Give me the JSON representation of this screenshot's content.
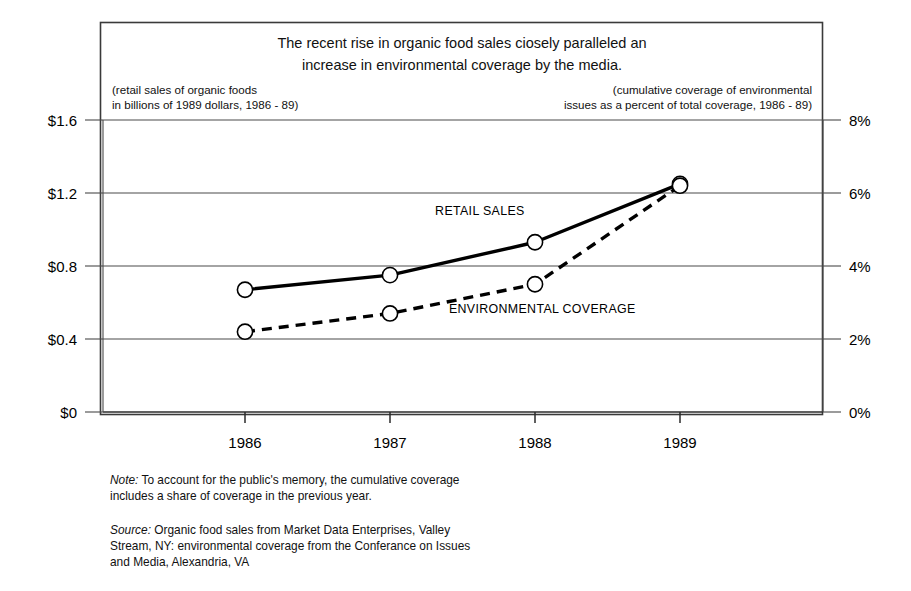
{
  "chart_data": {
    "type": "line",
    "title": "The recent rise in organic food sales ciosely paralleled an increase in environmental coverage by the media.",
    "title_line1": "The recent rise in organic food sales ciosely paralleled an",
    "title_line2": "increase in environmental coverage by the media.",
    "subtitle_left_line1": "(retail sales of organic foods",
    "subtitle_left_line2": "in billions of 1989 dollars, 1986 - 89)",
    "subtitle_right_line1": "(cumulative coverage of environmental",
    "subtitle_right_line2": "issues as a percent of total coverage, 1986 - 89)",
    "categories": [
      "1986",
      "1987",
      "1988",
      "1989"
    ],
    "x": [
      1986,
      1987,
      1988,
      1989
    ],
    "xlabel": "",
    "ylabel": "",
    "grid": true,
    "legend_position": "inline-annotations",
    "series": [
      {
        "name": "RETAIL SALES",
        "axis": "left",
        "style": "solid",
        "marker": "open-circle",
        "values": [
          0.67,
          0.75,
          0.93,
          1.25
        ],
        "unit": "billions of 1989 dollars"
      },
      {
        "name": "ENVIRONMENTAL COVERAGE",
        "axis": "right",
        "style": "dashed",
        "marker": "open-circle",
        "values": [
          2.2,
          2.7,
          3.5,
          6.2
        ],
        "unit": "percent of total coverage"
      }
    ],
    "yaxis_left": {
      "ticks": [
        0,
        0.4,
        0.8,
        1.2,
        1.6
      ],
      "tick_labels": [
        "$0",
        "$0.4",
        "$0.8",
        "$1.2",
        "$1.6"
      ],
      "ylim": [
        0,
        1.6
      ]
    },
    "yaxis_right": {
      "ticks": [
        0,
        2,
        4,
        6,
        8
      ],
      "tick_labels": [
        "0%",
        "2%",
        "4%",
        "6%",
        "8%"
      ],
      "ylim": [
        0,
        8
      ]
    },
    "annotations": [
      {
        "text": "RETAIL SALES",
        "x": 1987.62,
        "y_px": 215
      },
      {
        "text": "ENVIRONMENTAL COVERAGE",
        "x": 1988.05,
        "y_px": 313
      }
    ]
  },
  "footnotes": {
    "note_lead": "Note:",
    "note_line1": " To account for the public's memory, the cumulative coverage",
    "note_line2": "includes a share of coverage in the previous year.",
    "source_lead": "Source:",
    "source_line1": " Organic food sales from Market Data Enterprises, Valley",
    "source_line2": "Stream, NY: environmental coverage from the Conferance on Issues",
    "source_line3": "and Media, Alexandria, VA"
  },
  "colors": {
    "background": "#ffffff",
    "ink": "#000000",
    "frame": "#3a3a3a",
    "grid": "#4a4a4a"
  }
}
